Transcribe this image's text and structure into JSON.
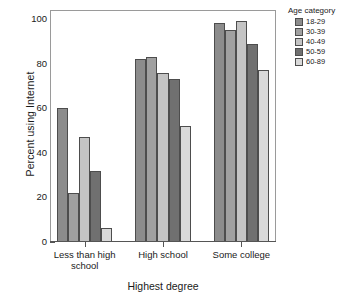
{
  "chart_data": {
    "type": "bar",
    "title": "",
    "subtitle": "",
    "xlabel": "Highest degree",
    "ylabel": "Percent using Internet",
    "categories": [
      "Less than high school",
      "High school",
      "Some college"
    ],
    "series": [
      {
        "name": "18-29",
        "color": "#8c8c8c",
        "values": [
          60,
          82,
          98
        ]
      },
      {
        "name": "30-39",
        "color": "#a0a0a0",
        "values": [
          22,
          83,
          95
        ]
      },
      {
        "name": "40-49",
        "color": "#c4c4c4",
        "values": [
          47,
          76,
          99
        ]
      },
      {
        "name": "50-59",
        "color": "#707070",
        "values": [
          32,
          73,
          89
        ]
      },
      {
        "name": "60-89",
        "color": "#d9d9d9",
        "values": [
          6.5,
          52,
          77
        ]
      }
    ],
    "legend_title": "Age category",
    "legend_position": "right",
    "ylim": [
      0,
      100
    ],
    "yticks": [
      0,
      20,
      40,
      60,
      80,
      100
    ],
    "ytick_labels": [
      "0",
      "20",
      "40",
      "60",
      "80",
      "100"
    ],
    "grid": false,
    "frame": true,
    "bar_edge_color": "#4d4d4d",
    "axis_color": "#555555"
  }
}
